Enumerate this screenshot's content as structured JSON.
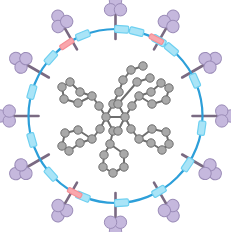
{
  "figure": {
    "background_color": "#ffffff",
    "width": 231,
    "height": 232
  },
  "palette": {
    "ring_blue": "#2d9fd9",
    "linker_light_blue": "#6fd0f0",
    "linker_light_blue_fill": "#a9e4f7",
    "marker_pink": "#f58e96",
    "marker_pink_fill": "#f9a7ad",
    "spoke_purple": "#7a6a82",
    "cluster_purple_fill": "#c5b8dd",
    "cluster_purple_stroke": "#9b8cb8",
    "atom_gray_fill": "#a9a9a9",
    "atom_gray_stroke": "#6e6e6e",
    "bond_gray": "#6e6e6e"
  },
  "ring": {
    "name": "macrocycle-ring",
    "center": {
      "x": 115.5,
      "y": 116
    },
    "radius": 87,
    "stroke_width": 2.2,
    "color": "#2d9fd9"
  },
  "linkers": {
    "count": 15,
    "label": "light-blue linker",
    "width": 7,
    "height": 14,
    "angles_deg": [
      -76,
      -50,
      -24,
      8,
      34,
      60,
      86,
      112,
      138,
      164,
      196,
      222,
      248,
      274,
      300
    ]
  },
  "pink_markers": {
    "count": 3,
    "label": "pink marker",
    "width": 5,
    "height": 15,
    "angles_deg": [
      -62,
      118,
      236
    ]
  },
  "spokes": {
    "count": 12,
    "label": "purple spoke",
    "inner_offset": -10,
    "outer_length": 26,
    "stroke_width": 2.6,
    "angles_deg": [
      -90,
      -60,
      -30,
      0,
      30,
      60,
      90,
      120,
      150,
      180,
      210,
      240
    ]
  },
  "clusters": {
    "count": 12,
    "label": "trefoil cluster",
    "lobe_radius": 6.2,
    "lobe_offset": 5.2,
    "distance": 110,
    "angles_deg": [
      -90,
      -60,
      -30,
      0,
      30,
      60,
      90,
      120,
      150,
      180,
      210,
      240
    ]
  },
  "core": {
    "name": "molecular-core",
    "description": "gray ball-and-stick tetra-aryl core with phenyl rings",
    "atom_radius": 4.2,
    "bond_width": 2.0,
    "hubs": [
      {
        "id": "hub-left",
        "x": 106,
        "y": 117
      },
      {
        "id": "hub-right",
        "x": 125,
        "y": 117
      }
    ],
    "atoms": [
      {
        "id": "a1",
        "x": 106,
        "y": 117
      },
      {
        "id": "a2",
        "x": 125,
        "y": 117
      },
      {
        "id": "a3",
        "x": 113,
        "y": 104
      },
      {
        "id": "a4",
        "x": 118,
        "y": 104
      },
      {
        "id": "a5",
        "x": 99,
        "y": 106
      },
      {
        "id": "a6",
        "x": 132,
        "y": 106
      },
      {
        "id": "a7",
        "x": 100,
        "y": 129
      },
      {
        "id": "a8",
        "x": 131,
        "y": 129
      },
      {
        "id": "a9",
        "x": 113,
        "y": 131
      },
      {
        "id": "a10",
        "x": 118,
        "y": 131
      },
      {
        "id": "r1a",
        "x": 92,
        "y": 96
      },
      {
        "id": "r1b",
        "x": 80,
        "y": 92
      },
      {
        "id": "r1c",
        "x": 70,
        "y": 82
      },
      {
        "id": "r1d",
        "x": 62,
        "y": 87
      },
      {
        "id": "r1e",
        "x": 64,
        "y": 99
      },
      {
        "id": "r1f",
        "x": 78,
        "y": 103
      },
      {
        "id": "r2a",
        "x": 139,
        "y": 96
      },
      {
        "id": "r2b",
        "x": 151,
        "y": 92
      },
      {
        "id": "r2c",
        "x": 161,
        "y": 83
      },
      {
        "id": "r2d",
        "x": 169,
        "y": 88
      },
      {
        "id": "r2e",
        "x": 166,
        "y": 100
      },
      {
        "id": "r2f",
        "x": 152,
        "y": 104
      },
      {
        "id": "r3a",
        "x": 92,
        "y": 139
      },
      {
        "id": "r3b",
        "x": 80,
        "y": 143
      },
      {
        "id": "r3c",
        "x": 69,
        "y": 151
      },
      {
        "id": "r3d",
        "x": 62,
        "y": 146
      },
      {
        "id": "r3e",
        "x": 65,
        "y": 133
      },
      {
        "id": "r3f",
        "x": 78,
        "y": 130
      },
      {
        "id": "r4a",
        "x": 139,
        "y": 139
      },
      {
        "id": "r4b",
        "x": 151,
        "y": 143
      },
      {
        "id": "r4c",
        "x": 162,
        "y": 150
      },
      {
        "id": "r4d",
        "x": 169,
        "y": 144
      },
      {
        "id": "r4e",
        "x": 166,
        "y": 132
      },
      {
        "id": "r4f",
        "x": 152,
        "y": 129
      },
      {
        "id": "r5a",
        "x": 110,
        "y": 144
      },
      {
        "id": "r5b",
        "x": 104,
        "y": 155
      },
      {
        "id": "r5c",
        "x": 103,
        "y": 167
      },
      {
        "id": "r5d",
        "x": 113,
        "y": 173
      },
      {
        "id": "r5e",
        "x": 124,
        "y": 167
      },
      {
        "id": "r5f",
        "x": 124,
        "y": 154
      },
      {
        "id": "t1",
        "x": 119,
        "y": 92
      },
      {
        "id": "t2",
        "x": 123,
        "y": 80
      },
      {
        "id": "t3",
        "x": 131,
        "y": 70
      },
      {
        "id": "t4",
        "x": 143,
        "y": 66
      },
      {
        "id": "t5",
        "x": 137,
        "y": 82
      },
      {
        "id": "t6",
        "x": 150,
        "y": 78
      }
    ],
    "bonds": [
      [
        "a1",
        "a2"
      ],
      [
        "a1",
        "a3"
      ],
      [
        "a2",
        "a4"
      ],
      [
        "a1",
        "a5"
      ],
      [
        "a2",
        "a6"
      ],
      [
        "a1",
        "a7"
      ],
      [
        "a2",
        "a8"
      ],
      [
        "a1",
        "a9"
      ],
      [
        "a2",
        "a10"
      ],
      [
        "a5",
        "r1a"
      ],
      [
        "r1a",
        "r1b"
      ],
      [
        "r1b",
        "r1c"
      ],
      [
        "r1c",
        "r1d"
      ],
      [
        "r1d",
        "r1e"
      ],
      [
        "r1e",
        "r1f"
      ],
      [
        "r1f",
        "r1a"
      ],
      [
        "a6",
        "r2a"
      ],
      [
        "r2a",
        "r2b"
      ],
      [
        "r2b",
        "r2c"
      ],
      [
        "r2c",
        "r2d"
      ],
      [
        "r2d",
        "r2e"
      ],
      [
        "r2e",
        "r2f"
      ],
      [
        "r2f",
        "r2a"
      ],
      [
        "a7",
        "r3a"
      ],
      [
        "r3a",
        "r3b"
      ],
      [
        "r3b",
        "r3c"
      ],
      [
        "r3c",
        "r3d"
      ],
      [
        "r3d",
        "r3e"
      ],
      [
        "r3e",
        "r3f"
      ],
      [
        "r3f",
        "r3a"
      ],
      [
        "a8",
        "r4a"
      ],
      [
        "r4a",
        "r4b"
      ],
      [
        "r4b",
        "r4c"
      ],
      [
        "r4c",
        "r4d"
      ],
      [
        "r4d",
        "r4e"
      ],
      [
        "r4e",
        "r4f"
      ],
      [
        "r4f",
        "r4a"
      ],
      [
        "a9",
        "r5a"
      ],
      [
        "r5a",
        "r5b"
      ],
      [
        "r5b",
        "r5c"
      ],
      [
        "r5c",
        "r5d"
      ],
      [
        "r5d",
        "r5e"
      ],
      [
        "r5e",
        "r5f"
      ],
      [
        "r5f",
        "r5a"
      ],
      [
        "a3",
        "t1"
      ],
      [
        "t1",
        "t2"
      ],
      [
        "t2",
        "t3"
      ],
      [
        "t3",
        "t4"
      ],
      [
        "a4",
        "t5"
      ],
      [
        "t5",
        "t6"
      ]
    ]
  }
}
